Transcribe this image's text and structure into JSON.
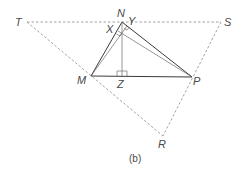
{
  "diagram": {
    "caption": "(b)",
    "points": {
      "T": {
        "label": "T",
        "x": 27,
        "y": 22
      },
      "S": {
        "label": "S",
        "x": 221,
        "y": 22
      },
      "N": {
        "label": "N",
        "x": 122,
        "y": 22
      },
      "M": {
        "label": "M",
        "x": 91,
        "y": 76
      },
      "P": {
        "label": "P",
        "x": 192,
        "y": 77
      },
      "R": {
        "label": "R",
        "x": 163,
        "y": 136
      },
      "Z": {
        "label": "Z",
        "x": 122,
        "y": 76
      },
      "X": {
        "label": "X",
        "x": 118,
        "y": 31
      },
      "Y": {
        "label": "Y",
        "x": 127,
        "y": 25
      }
    },
    "labels": {
      "T": "T",
      "S": "S",
      "N": "N",
      "X": "X",
      "Y": "Y",
      "M": "M",
      "Z": "Z",
      "P": "P",
      "R": "R"
    },
    "solid_segments": [
      "MN",
      "NP",
      "MP"
    ],
    "thin_segments": [
      "NZ",
      "MY",
      "PX"
    ],
    "dashed_segments": [
      "TS",
      "TR",
      "SR"
    ],
    "right_angles": [
      "Z",
      "X",
      "Y"
    ]
  }
}
